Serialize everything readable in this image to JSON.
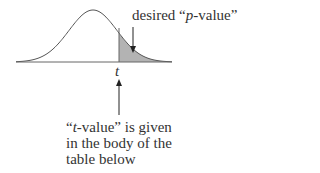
{
  "diagram": {
    "pvalue_label": {
      "prefix": "desired “",
      "italic": "p",
      "suffix": "-value”"
    },
    "t_label": "t",
    "caption_lines": [
      {
        "prefix": "“",
        "italic": "t",
        "suffix": "-value” is given"
      },
      {
        "text": "in the body of the"
      },
      {
        "text": "table below"
      }
    ],
    "colors": {
      "curve": "#555555",
      "axis": "#666666",
      "shade": "#b3b3b3",
      "text": "#333333"
    }
  }
}
